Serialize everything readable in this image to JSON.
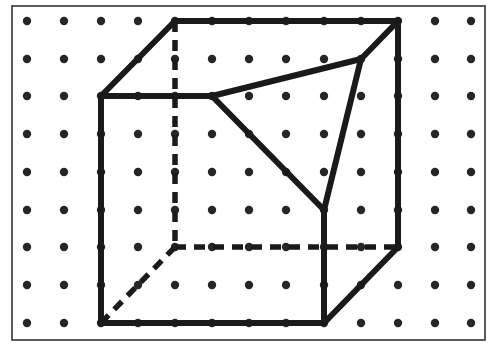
{
  "figure": {
    "colors": {
      "background": "#ffffff",
      "frame": "#333333",
      "dot": "#262626",
      "line": "#1a1a1a"
    },
    "frame": {
      "x": 12,
      "y": 6,
      "width": 473,
      "height": 334
    },
    "grid": {
      "columns": [
        27,
        64,
        101,
        138,
        175,
        212,
        249,
        286,
        324,
        361,
        398,
        435,
        471
      ],
      "rows": [
        21,
        59,
        96,
        134,
        172,
        210,
        247,
        285,
        323
      ],
      "dot_radius": 4.2
    },
    "solid_edges": [
      {
        "name": "back-top-edge",
        "from": [
          175,
          21
        ],
        "to": [
          398,
          21
        ]
      },
      {
        "name": "left-top-slant-edge",
        "from": [
          101,
          96
        ],
        "to": [
          175,
          21
        ]
      },
      {
        "name": "front-top-edge-remaining",
        "from": [
          101,
          96
        ],
        "to": [
          212,
          96
        ]
      },
      {
        "name": "front-left-edge",
        "from": [
          101,
          96
        ],
        "to": [
          101,
          323
        ]
      },
      {
        "name": "front-bottom-edge",
        "from": [
          101,
          323
        ],
        "to": [
          324,
          323
        ]
      },
      {
        "name": "front-right-edge-remaining",
        "from": [
          324,
          210
        ],
        "to": [
          324,
          323
        ]
      },
      {
        "name": "back-right-edge",
        "from": [
          398,
          21
        ],
        "to": [
          398,
          247
        ]
      },
      {
        "name": "right-bottom-slant-edge",
        "from": [
          398,
          247
        ],
        "to": [
          324,
          323
        ]
      },
      {
        "name": "right-top-slant-edge-remaining",
        "from": [
          361,
          59
        ],
        "to": [
          398,
          21
        ]
      },
      {
        "name": "cut-edge-top",
        "from": [
          212,
          96
        ],
        "to": [
          361,
          59
        ]
      },
      {
        "name": "cut-edge-left",
        "from": [
          212,
          96
        ],
        "to": [
          324,
          210
        ]
      },
      {
        "name": "cut-edge-right",
        "from": [
          361,
          59
        ],
        "to": [
          324,
          210
        ]
      }
    ],
    "hidden_edges": [
      {
        "name": "back-left-hidden-edge",
        "from": [
          175,
          21
        ],
        "to": [
          175,
          247
        ]
      },
      {
        "name": "back-bottom-hidden-edge",
        "from": [
          175,
          247
        ],
        "to": [
          398,
          247
        ]
      },
      {
        "name": "left-bottom-hidden-slant-edge",
        "from": [
          101,
          323
        ],
        "to": [
          175,
          247
        ]
      }
    ]
  }
}
